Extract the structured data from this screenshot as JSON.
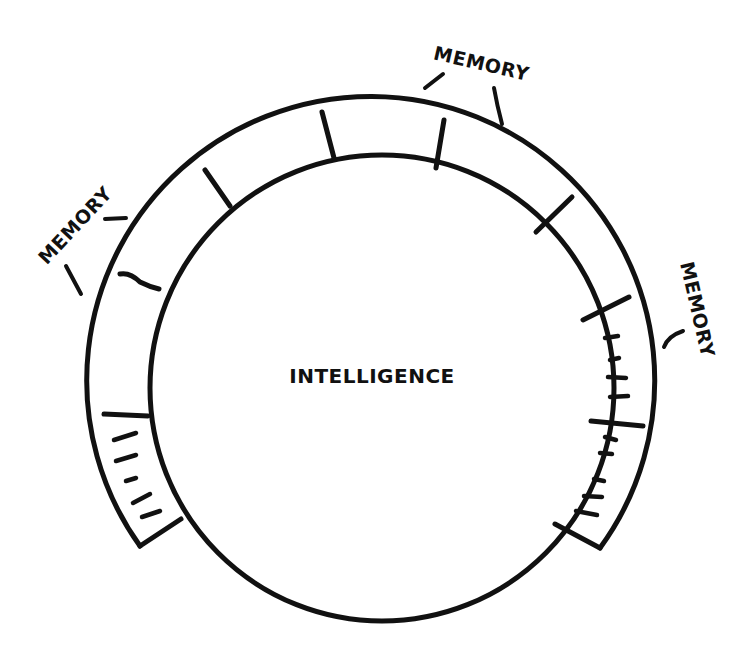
{
  "diagram": {
    "type": "ring-around-circle",
    "center_label": "INTELLIGENCE",
    "ring_label": "MEMORY",
    "labels": [
      {
        "id": "memory-top",
        "text": "MEMORY",
        "position": "top-right"
      },
      {
        "id": "memory-left",
        "text": "MEMORY",
        "position": "upper-left"
      },
      {
        "id": "memory-right",
        "text": "MEMORY",
        "position": "right"
      }
    ],
    "ring_segments": [
      {
        "index": 0,
        "position": "lower-left",
        "filled": true,
        "marks": 5
      },
      {
        "index": 1,
        "position": "left",
        "filled": false,
        "marks": 0
      },
      {
        "index": 2,
        "position": "upper-left",
        "filled": false,
        "marks": 0
      },
      {
        "index": 3,
        "position": "top-left",
        "filled": false,
        "marks": 0
      },
      {
        "index": 4,
        "position": "top",
        "filled": false,
        "marks": 0
      },
      {
        "index": 5,
        "position": "top-right",
        "filled": false,
        "marks": 0
      },
      {
        "index": 6,
        "position": "upper-right",
        "filled": false,
        "marks": 0
      },
      {
        "index": 7,
        "position": "right",
        "filled": true,
        "marks": 4
      },
      {
        "index": 8,
        "position": "lower-right",
        "filled": true,
        "marks": 5
      }
    ],
    "colors": {
      "ink": "#111111",
      "background": "#ffffff"
    }
  }
}
